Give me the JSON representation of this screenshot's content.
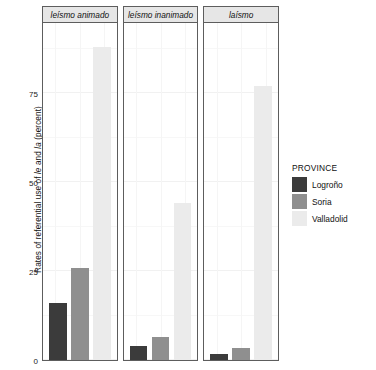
{
  "chart_data": {
    "type": "bar",
    "title": "",
    "xlabel": "",
    "ylabel": "Rates of referential use of le and la (percent)",
    "ylabel_parts": {
      "pre": "Rates of referential use of ",
      "italic1": "le",
      "mid": " and ",
      "italic2": "la",
      "post": " (percent)"
    },
    "ylim": [
      0,
      95
    ],
    "yticks": [
      0,
      25,
      50,
      75
    ],
    "ytick_labels": [
      "0",
      "25",
      "50",
      "75"
    ],
    "grid": true,
    "legend_position": "right",
    "legend_title": "PROVINCE",
    "facet_labels": [
      "leísmo animado",
      "leísmo inanimado",
      "laísmo"
    ],
    "categories": [
      "Logroño",
      "Soria",
      "Valladolid"
    ],
    "colors": [
      "#3b3b3b",
      "#8f8f8f",
      "#ebebeb"
    ],
    "panels": [
      {
        "label": "leísmo animado",
        "values": [
          16,
          26,
          88
        ]
      },
      {
        "label": "leísmo inanimado",
        "values": [
          4,
          6.5,
          44
        ]
      },
      {
        "label": "laísmo",
        "values": [
          1.7,
          3.5,
          77
        ]
      }
    ],
    "series": [
      {
        "name": "Logroño",
        "values": [
          16,
          4,
          1.7
        ]
      },
      {
        "name": "Soria",
        "values": [
          26,
          6.5,
          3.5
        ]
      },
      {
        "name": "Valladolid",
        "values": [
          88,
          44,
          77
        ]
      }
    ]
  },
  "legend": {
    "title": "PROVINCE",
    "items": [
      {
        "label": "Logroño",
        "color": "#3b3b3b"
      },
      {
        "label": "Soria",
        "color": "#8f8f8f"
      },
      {
        "label": "Valladolid",
        "color": "#ebebeb"
      }
    ]
  }
}
